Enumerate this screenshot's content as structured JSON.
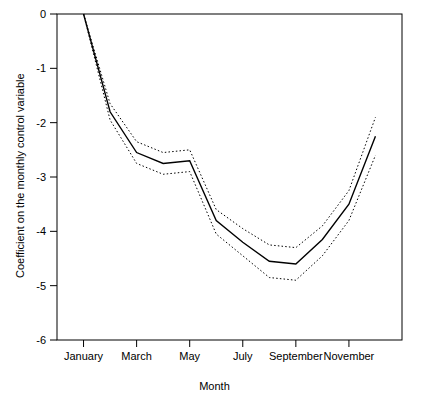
{
  "chart_data": {
    "type": "line",
    "title": "",
    "xlabel": "Month",
    "ylabel": "Coefficient on the monthly control variable",
    "xlim": [
      0,
      13
    ],
    "ylim": [
      -6,
      0
    ],
    "ytick_values": [
      0,
      -1,
      -2,
      -3,
      -4,
      -5,
      -6
    ],
    "ytick_labels": [
      "0",
      "-1",
      "-2",
      "-3",
      "-4",
      "-5",
      "-6"
    ],
    "xtick_values": [
      1,
      3,
      5,
      7,
      9,
      11
    ],
    "xtick_labels": [
      "January",
      "March",
      "May",
      "July",
      "September",
      "November"
    ],
    "grid": false,
    "legend": "none",
    "x": [
      1,
      2,
      3,
      4,
      5,
      6,
      7,
      8,
      9,
      10,
      11,
      12
    ],
    "series": [
      {
        "name": "Coefficient estimate",
        "style": "solid",
        "color": "#000000",
        "values": [
          0.0,
          -1.8,
          -2.55,
          -2.75,
          -2.7,
          -3.8,
          -4.2,
          -4.55,
          -4.6,
          -4.15,
          -3.5,
          -2.25
        ]
      },
      {
        "name": "Upper confidence bound",
        "style": "dotted",
        "color": "#000000",
        "values": [
          0.0,
          -1.65,
          -2.35,
          -2.55,
          -2.5,
          -3.6,
          -3.95,
          -4.25,
          -4.3,
          -3.9,
          -3.25,
          -1.9
        ]
      },
      {
        "name": "Lower confidence bound",
        "style": "dotted",
        "color": "#000000",
        "values": [
          0.0,
          -1.95,
          -2.75,
          -2.95,
          -2.9,
          -4.05,
          -4.45,
          -4.85,
          -4.9,
          -4.45,
          -3.8,
          -2.6
        ]
      }
    ]
  }
}
